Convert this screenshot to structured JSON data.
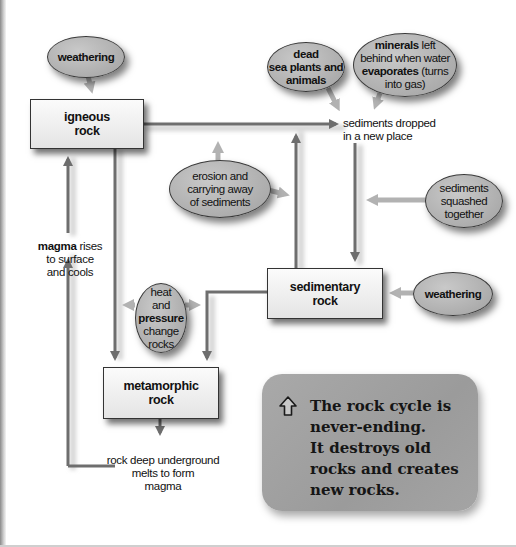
{
  "diagram": {
    "title": "The rock cycle",
    "nodes": {
      "igneous": {
        "line1": "igneous",
        "line2": "rock"
      },
      "sedimentary": {
        "line1": "sedimentary",
        "line2": "rock"
      },
      "metamorphic": {
        "line1": "metamorphic",
        "line2": "rock"
      }
    },
    "bubbles": {
      "weathering_top": {
        "text": "weathering"
      },
      "weathering_right": {
        "text": "weathering"
      },
      "dead_sea": {
        "line1": "dead",
        "line2": "sea plants and",
        "line3": "animals"
      },
      "minerals": {
        "bold1": "minerals",
        "rest1": " left",
        "line2": "behind when water",
        "bold3": "evaporates",
        "rest3": " (turns",
        "line4": "into gas)"
      },
      "erosion": {
        "line1": "erosion and",
        "line2": "carrying away",
        "line3": "of sediments"
      },
      "squashed": {
        "line1": "sediments",
        "line2": "squashed",
        "line3": "together"
      },
      "heat": {
        "line1": "heat",
        "line2": "and",
        "bold3": "pressure",
        "line4": "change",
        "line5": "rocks"
      }
    },
    "labels": {
      "sediments_dropped": {
        "line1": "sediments dropped",
        "line2": "in a new place"
      },
      "magma_rises": {
        "bold1": "magma",
        "rest1": " rises",
        "line2": "to surface",
        "line3": "and cools"
      },
      "rock_deep": {
        "line1": "rock deep underground",
        "line2": "melts to form",
        "line3": "magma"
      }
    },
    "callout": {
      "icon": "up-arrow-icon",
      "line1": "The rock cycle is",
      "line2": "never-ending.",
      "line3": "It destroys old",
      "line4": "rocks and creates",
      "line5": "new rocks."
    },
    "colors": {
      "arrow": "#6e6e6e",
      "bubble_fill": "#b4b4b4",
      "box_fill": "#eeeeee",
      "callout_fill": "#a3a3a3",
      "text": "#111111"
    }
  }
}
